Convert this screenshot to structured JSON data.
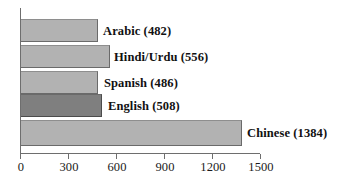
{
  "chart_data": {
    "type": "bar",
    "orientation": "horizontal",
    "title": "",
    "xlabel": "",
    "ylabel": "",
    "xlim": [
      0,
      1500
    ],
    "grid": false,
    "legend": null,
    "categories": [
      "Arabic",
      "Hindi/Urdu",
      "Spanish",
      "English",
      "Chinese"
    ],
    "values": [
      482,
      556,
      486,
      508,
      1384
    ],
    "data_labels": [
      "Arabic (482)",
      "Hindi/Urdu (556)",
      "Spanish (486)",
      "English (508)",
      "Chinese (1384)"
    ],
    "xticks": [
      0,
      300,
      600,
      900,
      1200,
      1500
    ],
    "xtick_labels": [
      "0",
      "300",
      "600",
      "900",
      "1200",
      "1500"
    ],
    "bar_colors": [
      "#b2b2b2",
      "#b2b2b2",
      "#b2b2b2",
      "#7f7f7f",
      "#b2b2b2"
    ],
    "highlighted_category": "English"
  },
  "axis": {
    "x_tick_labels": [
      "0",
      "300",
      "600",
      "900",
      "1200",
      "1500"
    ]
  },
  "bars": [
    {
      "label": "Arabic (482)",
      "name": "Arabic",
      "value": 482,
      "color": "#b2b2b2"
    },
    {
      "label": "Hindi/Urdu (556)",
      "name": "Hindi/Urdu",
      "value": 556,
      "color": "#b2b2b2"
    },
    {
      "label": "Spanish (486)",
      "name": "Spanish",
      "value": 486,
      "color": "#b2b2b2"
    },
    {
      "label": "English (508)",
      "name": "English",
      "value": 508,
      "color": "#7f7f7f"
    },
    {
      "label": "Chinese (1384)",
      "name": "Chinese",
      "value": 1384,
      "color": "#b2b2b2"
    }
  ]
}
